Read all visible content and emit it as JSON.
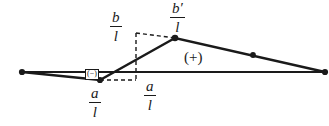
{
  "figure": {
    "background_color": "#ffffff",
    "line_color": "#1a1a1a",
    "labels": {
      "b_over_l": {
        "numerator": "b",
        "denominator": "l"
      },
      "bprime_over_l": {
        "numerator": "b′",
        "denominator": "l"
      },
      "a_over_l_left": {
        "numerator": "a",
        "denominator": "l"
      },
      "a_over_l_right": {
        "numerator": "a",
        "denominator": "l"
      },
      "positive_region": "(+)",
      "negative_region": "(−)"
    }
  },
  "geometry": {
    "baseline": {
      "x1": 22,
      "y1": 72,
      "x2": 325,
      "y2": 72
    },
    "polyline": [
      {
        "x": 22,
        "y": 72
      },
      {
        "x": 100,
        "y": 80
      },
      {
        "x": 175,
        "y": 38
      },
      {
        "x": 325,
        "y": 72
      }
    ],
    "nodes": [
      {
        "name": "left-endpoint",
        "x": 22,
        "y": 72
      },
      {
        "name": "dip-vertex",
        "x": 100,
        "y": 80
      },
      {
        "name": "peak-vertex",
        "x": 175,
        "y": 38
      },
      {
        "name": "mid-right-marker",
        "x": 253,
        "y": 55
      },
      {
        "name": "right-endpoint",
        "x": 325,
        "y": 72
      }
    ],
    "dashed": {
      "vertical": {
        "x": 136,
        "y1": 33,
        "y2": 80
      },
      "horizontal_to_peak": {
        "x1": 136,
        "y1": 33,
        "x2": 175,
        "y2": 38
      },
      "horizontal_to_dip": {
        "x1": 100,
        "y1": 80,
        "x2": 136,
        "y2": 80
      }
    }
  }
}
